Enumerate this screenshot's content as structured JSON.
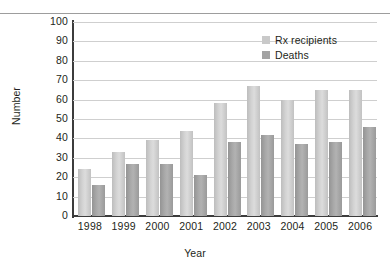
{
  "chart_data": {
    "type": "bar",
    "title": "",
    "xlabel": "Year",
    "ylabel": "Number",
    "categories": [
      "1998",
      "1999",
      "2000",
      "2001",
      "2002",
      "2003",
      "2004",
      "2005",
      "2006"
    ],
    "series": [
      {
        "name": "Rx recipients",
        "color": "#d3d3d3",
        "values": [
          24,
          33,
          39,
          44,
          58,
          67,
          60,
          65,
          65
        ]
      },
      {
        "name": "Deaths",
        "color": "#a3a3a3",
        "values": [
          16,
          27,
          27,
          21,
          38,
          42,
          37,
          38,
          46
        ]
      }
    ],
    "ylim": [
      0,
      100
    ],
    "yticks": [
      0,
      10,
      20,
      30,
      40,
      50,
      60,
      70,
      80,
      90,
      100
    ],
    "ytick_labels": [
      "0",
      "10",
      "20",
      "30",
      "40",
      "50",
      "60",
      "70",
      "80",
      "90",
      "100"
    ],
    "grid": "horizontal",
    "legend_position": "top-right",
    "legend": [
      "Rx recipients",
      "Deaths"
    ]
  }
}
